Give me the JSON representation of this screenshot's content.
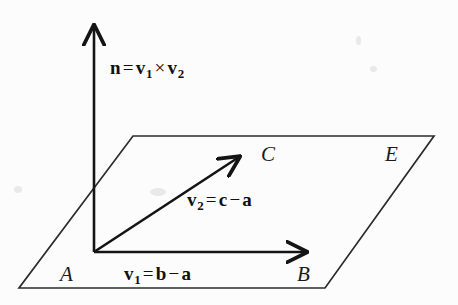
{
  "figure": {
    "background_color": "#fcfcfc",
    "ink_color": "#141414"
  },
  "labels": {
    "normal_vector": {
      "lhs": "n",
      "equals": "=",
      "v1": "v",
      "v1_sub": "1",
      "times": "×",
      "v2": "v",
      "v2_sub": "2",
      "full_text": "n = v1 × v2"
    },
    "vector_v2": {
      "name": "v",
      "name_sub": "2",
      "equals": "=",
      "term1": "c",
      "minus": "−",
      "term2": "a",
      "full_text": "v2 = c − a"
    },
    "vector_v1": {
      "name": "v",
      "name_sub": "1",
      "equals": "=",
      "term1": "b",
      "minus": "−",
      "term2": "a",
      "full_text": "v1 = b − a"
    },
    "point_a": "A",
    "point_b": "B",
    "point_c": "C",
    "plane_e": "E"
  },
  "geometry": {
    "plane": {
      "shape": "parallelogram",
      "corners": [
        [
          133,
          136
        ],
        [
          434,
          136
        ],
        [
          325,
          288
        ],
        [
          19,
          288
        ]
      ]
    },
    "origin": [
      94,
      252
    ],
    "normal_axis": {
      "from": [
        94,
        252
      ],
      "to": [
        94,
        20
      ]
    },
    "vector_v1_arrow": {
      "from": [
        94,
        252
      ],
      "to": [
        312,
        252
      ]
    },
    "vector_v2_arrow": {
      "from": [
        94,
        252
      ],
      "to": [
        243,
        153
      ]
    }
  }
}
